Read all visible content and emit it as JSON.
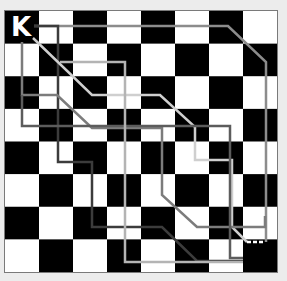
{
  "board": {
    "rows": 8,
    "cols": 8,
    "origin": [
      5,
      11
    ],
    "size": [
      272,
      261
    ],
    "dark_color": "#000000",
    "light_color": "#ffffff",
    "border_color": "#7a7a7a",
    "background": "#ececec",
    "dark_when_sum_even": true
  },
  "piece": {
    "label": "K",
    "color": "#ffffff",
    "position": [
      0,
      0
    ]
  },
  "paths": [
    {
      "name": "path-top",
      "color": "#8c8c8c",
      "points": [
        [
          34,
          26
        ],
        [
          228,
          26
        ],
        [
          266,
          62
        ],
        [
          266,
          242
        ]
      ]
    },
    {
      "name": "path-dark",
      "color": "#3c3c3c",
      "points": [
        [
          34,
          26
        ],
        [
          58,
          26
        ],
        [
          58,
          162
        ],
        [
          92,
          162
        ],
        [
          92,
          227
        ],
        [
          162,
          227
        ],
        [
          197,
          261
        ],
        [
          243,
          261
        ]
      ]
    },
    {
      "name": "path-light-diagonal",
      "color": "#cfcfcf",
      "points": [
        [
          33,
          38
        ],
        [
          92,
          95
        ],
        [
          160,
          95
        ],
        [
          195,
          127
        ],
        [
          195,
          160
        ],
        [
          232,
          160
        ],
        [
          232,
          227
        ],
        [
          247,
          242
        ]
      ]
    },
    {
      "name": "path-light-dashed-end",
      "color": "#ffffff",
      "dashed": true,
      "points": [
        [
          247,
          242
        ],
        [
          265,
          242
        ]
      ]
    },
    {
      "name": "path-medium",
      "color": "#7c7c7c",
      "points": [
        [
          22,
          42
        ],
        [
          22,
          95
        ],
        [
          57,
          95
        ],
        [
          92,
          128
        ],
        [
          162,
          128
        ],
        [
          162,
          195
        ],
        [
          197,
          227
        ],
        [
          265,
          227
        ],
        [
          265,
          216
        ]
      ]
    },
    {
      "name": "path-medium-dark",
      "color": "#5c5c5c",
      "points": [
        [
          22,
          95
        ],
        [
          22,
          126
        ],
        [
          230,
          126
        ],
        [
          230,
          258
        ],
        [
          243,
          258
        ]
      ]
    },
    {
      "name": "path-light",
      "color": "#b4b4b4",
      "points": [
        [
          60,
          62
        ],
        [
          125,
          62
        ],
        [
          125,
          262
        ],
        [
          243,
          262
        ]
      ]
    }
  ]
}
